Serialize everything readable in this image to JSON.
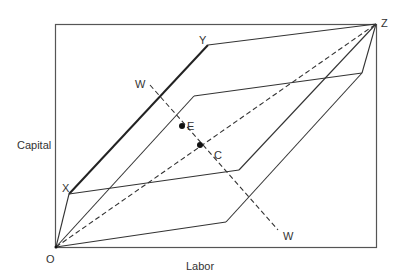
{
  "diagram": {
    "type": "Edgeworth box (production)",
    "axis_labels": {
      "x": "Labor",
      "y": "Capital"
    },
    "points": {
      "O": {
        "label": "O",
        "x": 56,
        "y": 247
      },
      "Z": {
        "label": "Z",
        "x": 376,
        "y": 24
      },
      "X": {
        "label": "X",
        "x": 69,
        "y": 194
      },
      "Y": {
        "label": "Y",
        "x": 208,
        "y": 45
      },
      "E": {
        "label": "E",
        "x": 182,
        "y": 126
      },
      "C": {
        "label": "C",
        "x": 200,
        "y": 145
      },
      "W1": {
        "label": "W",
        "x": 150,
        "y": 83
      },
      "W2": {
        "label": "W",
        "x": 278,
        "y": 230
      }
    },
    "labels": {
      "O": "O",
      "Z": "Z",
      "X": "X",
      "Y": "Y",
      "E": "E",
      "C": "C",
      "W_top": "W",
      "W_bottom": "W",
      "xaxis": "Labor",
      "yaxis": "Capital"
    },
    "colors": {
      "line": "#3a3a3a",
      "frame": "#555555",
      "background": "#ffffff"
    }
  }
}
